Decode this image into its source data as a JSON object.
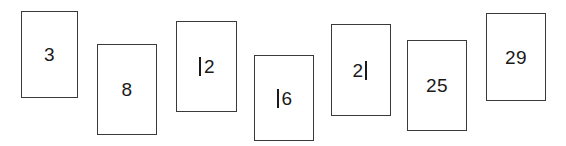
{
  "canvas": {
    "width": 566,
    "height": 146,
    "background_color": "#ffffff"
  },
  "figure": {
    "type": "staggered-rectangle-number-sequence",
    "stroke_color": "#3a3a3a",
    "fill_color": "#ffffff",
    "text_color": "#1a1a1a"
  },
  "cards": [
    {
      "label": "3",
      "x": 21,
      "y": 11,
      "width": 57,
      "height": 87
    },
    {
      "label": "8",
      "x": 97,
      "y": 44,
      "width": 60,
      "height": 91
    },
    {
      "label": "12",
      "x": 176,
      "y": 21,
      "width": 61,
      "height": 91
    },
    {
      "label": "16",
      "x": 254,
      "y": 55,
      "width": 60,
      "height": 86
    },
    {
      "label": "21",
      "x": 331,
      "y": 24,
      "width": 60,
      "height": 92
    },
    {
      "label": "25",
      "x": 407,
      "y": 40,
      "width": 60,
      "height": 91
    },
    {
      "label": "29",
      "x": 486,
      "y": 13,
      "width": 60,
      "height": 88
    }
  ]
}
